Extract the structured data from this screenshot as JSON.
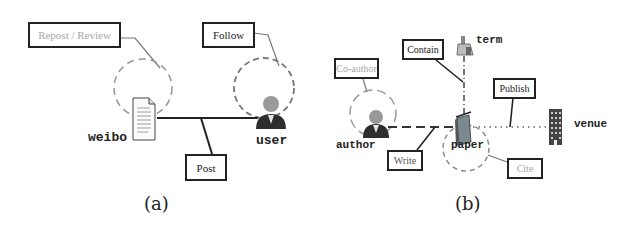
{
  "panel_a": {
    "caption": "(a)",
    "nodes": {
      "weibo": "weibo",
      "user": "user"
    },
    "relations": {
      "repost_review": "Repost / Review",
      "follow": "Follow",
      "post": "Post"
    }
  },
  "panel_b": {
    "caption": "(b)",
    "nodes": {
      "term": "term",
      "author": "author",
      "paper": "paper",
      "venue": "venue"
    },
    "relations": {
      "contain": "Contain",
      "co_author": "Co-author",
      "write": "Write",
      "publish": "Publish",
      "cite": "Cite"
    }
  },
  "colors": {
    "line": "#222222",
    "connector": "#777777",
    "dashed_circle": "#8a8a8a",
    "faded_text": "#a8a8a8"
  }
}
